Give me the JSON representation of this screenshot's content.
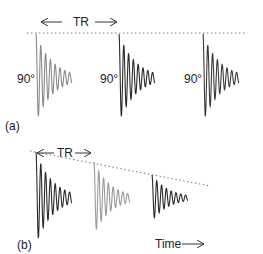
{
  "panel_a": {
    "label": "(a)",
    "tr_label": "TR",
    "pulse_label": "90°",
    "pulses": [
      {
        "x": 36,
        "amp": 1.0,
        "color": "#8a8a8a"
      },
      {
        "x": 119,
        "amp": 1.0,
        "color": "#2a2a2a"
      },
      {
        "x": 203,
        "amp": 1.0,
        "color": "#3a3a3a"
      }
    ]
  },
  "panel_b": {
    "label": "(b)",
    "tr_label": "TR",
    "time_label": "Time",
    "pulses": [
      {
        "x": 36,
        "amp": 1.0,
        "color": "#2a2a2a"
      },
      {
        "x": 94,
        "amp": 0.78,
        "color": "#9a9a9a"
      },
      {
        "x": 152,
        "amp": 0.5,
        "color": "#2a2a2a"
      }
    ]
  }
}
